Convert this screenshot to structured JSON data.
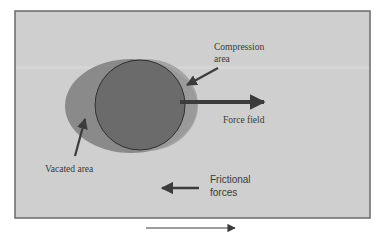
{
  "diagram": {
    "colors": {
      "page_background": "#ffffff",
      "panel_background": "#cfcfcf",
      "panel_border": "#6a6a6a",
      "vacated_ellipse": "#8a8a8a",
      "compression_ring": "#9c9c9c",
      "particle_circle": "#6b6b6b",
      "particle_outline": "#2e2e2e",
      "arrow": "#3c3c3c",
      "text": "#3a3a3a"
    },
    "labels": {
      "compression_line1": "Compression",
      "compression_line2": "area",
      "force_field": "Force field",
      "vacated_area": "Vacated area",
      "frictional_line1": "Frictional",
      "frictional_line2": "forces"
    },
    "arrows": [
      {
        "name": "compression-pointer-arrow",
        "direction": "down-left"
      },
      {
        "name": "force-field-arrow",
        "direction": "right"
      },
      {
        "name": "vacated-pointer-arrow",
        "direction": "up"
      },
      {
        "name": "frictional-forces-arrow",
        "direction": "left"
      },
      {
        "name": "motion-direction-arrow",
        "direction": "right"
      }
    ]
  }
}
